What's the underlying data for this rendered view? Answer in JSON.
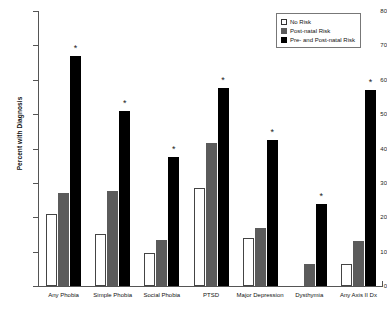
{
  "chart_data": {
    "type": "bar",
    "title": "",
    "xlabel": "",
    "ylabel": "Percent with Diagnosis",
    "ylim": [
      0,
      80
    ],
    "yticks": [
      0,
      10,
      20,
      30,
      40,
      50,
      60,
      70,
      80
    ],
    "grid": false,
    "legend_position": "top-right",
    "categories": [
      "Any Phobia",
      "Simple Phobia",
      "Social Phobia",
      "PTSD",
      "Major Depression",
      "Dysthymia",
      "Any Axis II Dx"
    ],
    "series": [
      {
        "name": "No Risk",
        "color": "#ffffff",
        "values": [
          21,
          15,
          9.5,
          28.5,
          14,
          0,
          6.5
        ]
      },
      {
        "name": "Post-natal Risk",
        "color": "#5b5b5b",
        "values": [
          27,
          27.5,
          13.5,
          41.5,
          17,
          6.5,
          13
        ]
      },
      {
        "name": "Pre- and Post-natal Risk",
        "color": "#000000",
        "values": [
          67,
          51,
          37.5,
          57.5,
          42.5,
          24,
          57
        ]
      }
    ],
    "annotations": {
      "symbol": "*",
      "marked_series": "Pre- and Post-natal Risk",
      "marked_categories": [
        "Any Phobia",
        "Simple Phobia",
        "Social Phobia",
        "PTSD",
        "Major Depression",
        "Dysthymia",
        "Any Axis II Dx"
      ]
    }
  },
  "legend": {
    "items": [
      {
        "label": "No Risk"
      },
      {
        "label": "Post-natal Risk"
      },
      {
        "label": "Pre- and Post-natal Risk"
      }
    ]
  }
}
